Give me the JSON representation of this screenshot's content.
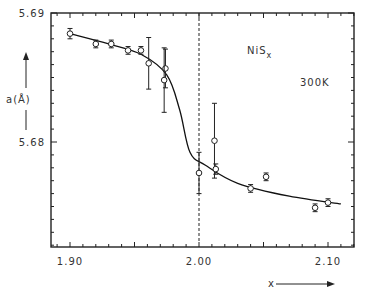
{
  "chart_data": {
    "type": "scatter",
    "title": "",
    "annotations": [
      {
        "text": "NiS",
        "subscript": "x",
        "role": "compound-label"
      },
      {
        "text": "300K",
        "role": "temperature-label"
      }
    ],
    "xlabel": "x",
    "ylabel": "a(Å)",
    "xlim": [
      1.885,
      2.12
    ],
    "ylim": [
      5.6718,
      5.69
    ],
    "x_ticks": [
      1.9,
      2.0,
      2.1
    ],
    "x_tick_labels": [
      "1.90",
      "2.00",
      "2.10"
    ],
    "y_ticks": [
      5.68,
      5.69
    ],
    "y_tick_labels": [
      "5.68",
      "5.69"
    ],
    "grid": false,
    "vertical_reference_line": {
      "x": 2.0,
      "style": "dashed"
    },
    "series": [
      {
        "name": "measured",
        "marker": "open-circle",
        "points": [
          {
            "x": 1.9,
            "y": 5.6884,
            "err": 0.0004
          },
          {
            "x": 1.92,
            "y": 5.6876,
            "err": 0.0003
          },
          {
            "x": 1.932,
            "y": 5.6876,
            "err": 0.0003
          },
          {
            "x": 1.945,
            "y": 5.6871,
            "err": 0.0003
          },
          {
            "x": 1.955,
            "y": 5.6871,
            "err": 0.0003
          },
          {
            "x": 1.961,
            "y": 5.6861,
            "err": 0.002
          },
          {
            "x": 1.974,
            "y": 5.6857,
            "err": 0.0015
          },
          {
            "x": 1.973,
            "y": 5.6848,
            "err": 0.0025
          },
          {
            "x": 2.0,
            "y": 5.6776,
            "err": 0.0016
          },
          {
            "x": 2.012,
            "y": 5.6801,
            "err": 0.0029
          },
          {
            "x": 2.013,
            "y": 5.6779,
            "err": 0.0004
          },
          {
            "x": 2.04,
            "y": 5.6764,
            "err": 0.0003
          },
          {
            "x": 2.052,
            "y": 5.6773,
            "err": 0.0003
          },
          {
            "x": 2.09,
            "y": 5.6749,
            "err": 0.0003
          },
          {
            "x": 2.1,
            "y": 5.6753,
            "err": 0.0003
          }
        ]
      },
      {
        "name": "fit-curve",
        "type": "line",
        "points": [
          {
            "x": 1.9,
            "y": 5.6884
          },
          {
            "x": 1.93,
            "y": 5.6876
          },
          {
            "x": 1.955,
            "y": 5.6868
          },
          {
            "x": 1.975,
            "y": 5.6852
          },
          {
            "x": 1.985,
            "y": 5.6825
          },
          {
            "x": 1.993,
            "y": 5.6792
          },
          {
            "x": 2.005,
            "y": 5.6782
          },
          {
            "x": 2.03,
            "y": 5.6768
          },
          {
            "x": 2.07,
            "y": 5.6758
          },
          {
            "x": 2.11,
            "y": 5.6752
          }
        ]
      }
    ]
  }
}
